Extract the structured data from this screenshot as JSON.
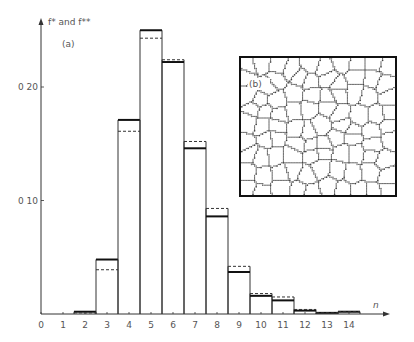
{
  "chart_data": {
    "type": "bar",
    "title": "",
    "panel_label": "(a)",
    "inset_label": "(b)",
    "inset_description": "Two-dimensional cellular (grain) network micrograph",
    "xlabel": "n",
    "ylabel": "f* and f**",
    "x_ticks": [
      "0",
      "1",
      "2",
      "3",
      "4",
      "5",
      "6",
      "7",
      "8",
      "9",
      "10",
      "11",
      "12",
      "13",
      "14"
    ],
    "y_ticks": [
      {
        "value": 0.1,
        "label": "0.10"
      },
      {
        "value": 0.2,
        "label": "0.20"
      }
    ],
    "ylim": [
      0,
      0.26
    ],
    "xlim": [
      0,
      15.5
    ],
    "grid": false,
    "categories": [
      2,
      3,
      4,
      5,
      6,
      7,
      8,
      9,
      10,
      11,
      12,
      13,
      14
    ],
    "series": [
      {
        "name": "f*",
        "style": "solid",
        "values": [
          0.002,
          0.048,
          0.171,
          0.25,
          0.222,
          0.146,
          0.086,
          0.037,
          0.016,
          0.012,
          0.003,
          0.001,
          0.002
        ]
      },
      {
        "name": "f**",
        "style": "dashed",
        "values": [
          0.001,
          0.039,
          0.161,
          0.243,
          0.224,
          0.152,
          0.093,
          0.042,
          0.018,
          0.015,
          0.004,
          0.001,
          0.002
        ]
      }
    ]
  },
  "labels": {
    "ylabel": "f* and f**",
    "panel_a": "(a)",
    "panel_b": "(b)",
    "xlabel": "n"
  }
}
